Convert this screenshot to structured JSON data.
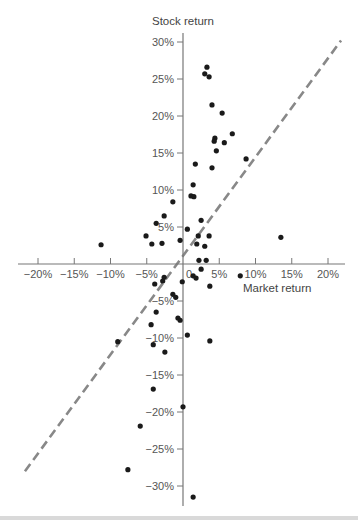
{
  "chart_data": {
    "type": "scatter",
    "title": "",
    "xlabel": "Market return",
    "ylabel": "Stock return",
    "xlim": [
      -22,
      22
    ],
    "ylim": [
      -33,
      32
    ],
    "grid": false,
    "legend": null,
    "x_ticks": [
      -20,
      -15,
      -10,
      -5,
      0,
      5,
      10,
      15,
      20
    ],
    "x_tick_labels": [
      "−20%",
      "−15%",
      "−10%",
      "−5%",
      "0",
      "5%",
      "10%",
      "15%",
      "20%"
    ],
    "y_ticks": [
      30,
      25,
      20,
      15,
      10,
      5,
      -5,
      -10,
      -15,
      -20,
      -25,
      -30
    ],
    "y_tick_labels": [
      "30%",
      "25%",
      "20%",
      "15%",
      "10%",
      "5%",
      "−5%",
      "−10%",
      "−15%",
      "−20%",
      "−25%",
      "−30%"
    ],
    "points": [
      [
        3.3,
        26.6
      ],
      [
        3.0,
        25.7
      ],
      [
        3.6,
        25.3
      ],
      [
        4.0,
        21.5
      ],
      [
        5.4,
        20.4
      ],
      [
        4.4,
        17.0
      ],
      [
        4.3,
        16.6
      ],
      [
        5.7,
        16.4
      ],
      [
        6.8,
        17.6
      ],
      [
        4.6,
        15.3
      ],
      [
        8.7,
        14.2
      ],
      [
        1.7,
        13.5
      ],
      [
        4.0,
        13.0
      ],
      [
        1.4,
        10.7
      ],
      [
        1.1,
        9.2
      ],
      [
        1.5,
        9.1
      ],
      [
        -1.4,
        8.4
      ],
      [
        -2.6,
        6.5
      ],
      [
        -3.7,
        5.5
      ],
      [
        2.5,
        5.9
      ],
      [
        -5.1,
        3.8
      ],
      [
        -4.3,
        2.7
      ],
      [
        -2.9,
        2.8
      ],
      [
        -0.4,
        3.2
      ],
      [
        0.6,
        4.7
      ],
      [
        3.6,
        3.8
      ],
      [
        2.1,
        3.8
      ],
      [
        1.9,
        2.7
      ],
      [
        3.0,
        2.4
      ],
      [
        -11.3,
        2.6
      ],
      [
        13.5,
        3.6
      ],
      [
        2.2,
        0.5
      ],
      [
        3.2,
        0.5
      ],
      [
        2.5,
        -0.7
      ],
      [
        1.4,
        -1.6
      ],
      [
        1.8,
        -1.9
      ],
      [
        -0.1,
        -2.4
      ],
      [
        3.7,
        -3.0
      ],
      [
        7.9,
        -1.6
      ],
      [
        -2.6,
        -1.8
      ],
      [
        -2.8,
        -2.3
      ],
      [
        -3.9,
        -2.7
      ],
      [
        -1.4,
        -4.1
      ],
      [
        -1.0,
        -4.5
      ],
      [
        -3.7,
        -6.5
      ],
      [
        -0.7,
        -7.3
      ],
      [
        -0.4,
        -7.6
      ],
      [
        -4.4,
        -8.2
      ],
      [
        -9.0,
        -10.5
      ],
      [
        -4.1,
        -10.9
      ],
      [
        0.6,
        -9.6
      ],
      [
        3.7,
        -10.4
      ],
      [
        -2.5,
        -11.9
      ],
      [
        -4.1,
        -16.9
      ],
      [
        0.0,
        -19.3
      ],
      [
        -5.9,
        -21.9
      ],
      [
        -7.6,
        -27.8
      ],
      [
        1.4,
        -31.5
      ]
    ],
    "fit_line": {
      "style": "dashed",
      "color": "#888888",
      "from": [
        -21.8,
        -28.0
      ],
      "to": [
        21.8,
        30.2
      ],
      "slope_approx": 1.33
    },
    "colors": {
      "points": "#1a1a1a",
      "axes": "#777777",
      "text": "#555555"
    }
  }
}
